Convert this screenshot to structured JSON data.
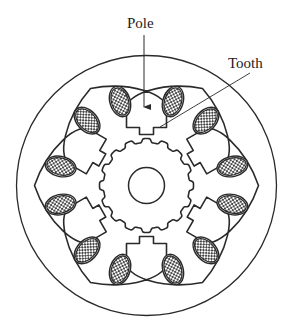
{
  "diagram": {
    "labels": {
      "pole": "Pole",
      "tooth": "Tooth"
    },
    "geometry": {
      "center": [
        146.5,
        185.5
      ],
      "outer_radius": 130,
      "shaft_radius": 18,
      "rotor_radius": 47,
      "rotor_teeth": 16,
      "rotor_tooth_depth": 4,
      "stator_pole_count": 6,
      "stator_pole_angles_deg": [
        90,
        150,
        210,
        270,
        330,
        30
      ],
      "pole_half_width": 20,
      "pole_face_radius": 58,
      "pole_tooth_half_width": 7,
      "pole_tooth_radius": 51,
      "slot_outer_radius": 106,
      "coil_radius": 88,
      "coil_angle_offset_deg": 12.5,
      "coil_rx": 14,
      "coil_ry": 8.5
    },
    "annotations": {
      "pole_arrow": {
        "from": [
          144,
          35
        ],
        "to": [
          144,
          114
        ]
      },
      "tooth_leader": {
        "from": [
          250,
          73
        ],
        "to": [
          160,
          127
        ]
      }
    },
    "colors": {
      "stroke": "#2a2a2a",
      "background": "#ffffff",
      "coil_hatch": "#333333"
    }
  }
}
